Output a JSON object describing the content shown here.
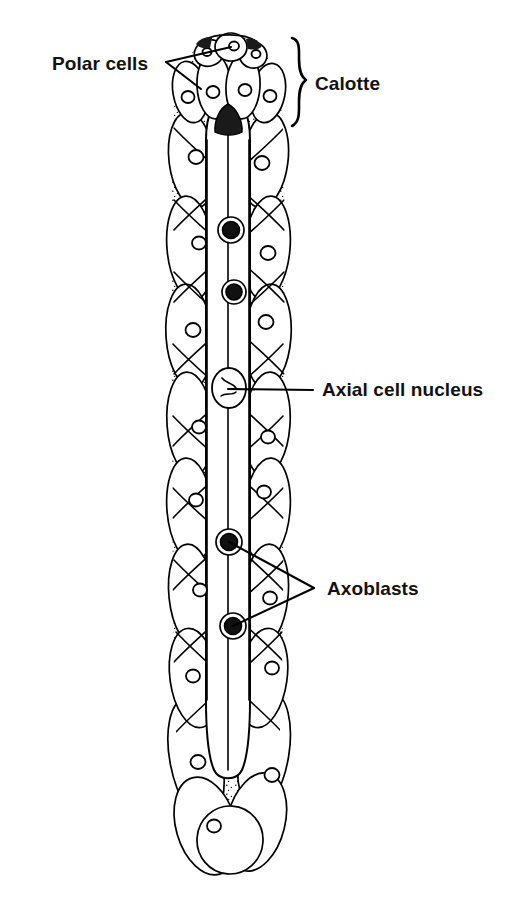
{
  "figure": {
    "background_color": "#ffffff",
    "ink_color": "#000000",
    "width": 530,
    "height": 897
  },
  "labels": [
    {
      "id": "polar-cells",
      "text": "Polar cells",
      "x": 52,
      "y": 70,
      "anchor": "start",
      "leader_vertex": [
        166,
        62
      ],
      "leader_targets": [
        [
          231,
          47
        ],
        [
          201,
          89
        ]
      ]
    },
    {
      "id": "calotte",
      "text": "Calotte",
      "x": 315,
      "y": 90,
      "anchor": "start",
      "brace": {
        "x": 290,
        "top": 38,
        "bottom": 126,
        "tip": 305
      }
    },
    {
      "id": "axial-cell-nucleus",
      "text": "Axial cell nucleus",
      "x": 322,
      "y": 396,
      "anchor": "start",
      "leader_vertex": [
        313,
        390
      ],
      "leader_targets": [
        [
          228,
          389
        ]
      ]
    },
    {
      "id": "axoblasts",
      "text": "Axoblasts",
      "x": 327,
      "y": 595,
      "anchor": "start",
      "leader_vertex": [
        314,
        588
      ],
      "leader_targets": [
        [
          229,
          542
        ],
        [
          233,
          626
        ]
      ]
    }
  ],
  "organism": {
    "name": "dicyemid-mesozoan",
    "apex_y": 33,
    "base_y": 874,
    "body_left": 170,
    "body_right": 288,
    "axis_x": 228,
    "regions": [
      {
        "name": "calotte",
        "top": 33,
        "bottom": 126
      },
      {
        "name": "trunk",
        "top": 126,
        "bottom": 700
      },
      {
        "name": "tail",
        "top": 700,
        "bottom": 874
      }
    ]
  },
  "structures": {
    "polar_cells": [
      {
        "cx": 209,
        "cy": 52,
        "rx": 15,
        "ry": 12,
        "rot": -22,
        "nucleus": [
          207,
          51,
          4
        ]
      },
      {
        "cx": 231,
        "cy": 47,
        "rx": 16,
        "ry": 13,
        "rot": 4,
        "nucleus": [
          234,
          46,
          5
        ]
      },
      {
        "cx": 253,
        "cy": 54,
        "rx": 14,
        "ry": 12,
        "rot": 20,
        "nucleus": [
          255,
          53,
          4
        ]
      }
    ],
    "calotte_cells": [
      {
        "cx": 190,
        "cy": 92,
        "rx": 17,
        "ry": 30,
        "rot": -10,
        "nucleus": [
          188,
          96,
          6
        ]
      },
      {
        "cx": 215,
        "cy": 86,
        "rx": 17,
        "ry": 32,
        "rot": -3,
        "nucleus": [
          213,
          92,
          6
        ]
      },
      {
        "cx": 243,
        "cy": 86,
        "rx": 17,
        "ry": 32,
        "rot": 3,
        "nucleus": [
          245,
          90,
          6
        ]
      },
      {
        "cx": 268,
        "cy": 93,
        "rx": 16,
        "ry": 29,
        "rot": 11,
        "nucleus": [
          270,
          95,
          6
        ]
      }
    ],
    "axial_cell": {
      "top": 96,
      "bottom": 775,
      "left": 206,
      "right": 250,
      "nucleus": {
        "cx": 229,
        "cy": 388,
        "rx": 17,
        "ry": 20
      }
    },
    "axoblasts": [
      {
        "cx": 231,
        "cy": 230,
        "r": 11
      },
      {
        "cx": 234,
        "cy": 292,
        "r": 10
      },
      {
        "cx": 229,
        "cy": 542,
        "r": 11
      },
      {
        "cx": 233,
        "cy": 626,
        "r": 11
      }
    ],
    "peripheral_nuclei": [
      [
        196,
        157,
        7
      ],
      [
        262,
        163,
        7
      ],
      [
        199,
        243,
        6
      ],
      [
        268,
        253,
        7
      ],
      [
        193,
        330,
        7
      ],
      [
        266,
        322,
        7
      ],
      [
        199,
        427,
        6
      ],
      [
        268,
        437,
        6
      ],
      [
        196,
        500,
        6
      ],
      [
        264,
        492,
        6
      ],
      [
        200,
        590,
        6
      ],
      [
        270,
        598,
        6
      ],
      [
        193,
        676,
        6
      ],
      [
        272,
        668,
        6
      ],
      [
        198,
        762,
        7
      ],
      [
        272,
        775,
        7
      ]
    ]
  },
  "style_notes": {
    "technique": "stippled ink line drawing",
    "line_color": "#000000",
    "fill_color": "#ffffff",
    "stipple_color": "#1a1a1a"
  }
}
